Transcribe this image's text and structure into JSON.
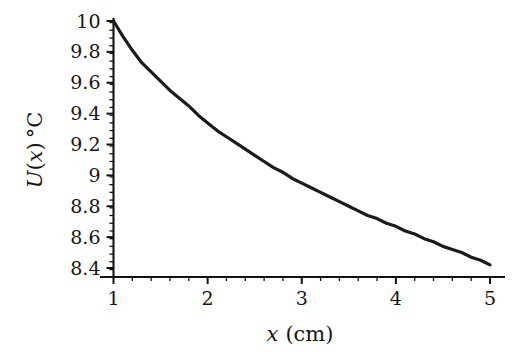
{
  "figure": {
    "background_color": "#ffffff",
    "curve_color": "#1b1b1b",
    "axis_color": "#111111"
  },
  "chart_data": {
    "type": "line",
    "title": "",
    "subtitle": "",
    "xlabel": "x (cm)",
    "xlabel_parts": {
      "variable": "x",
      "unit": "(cm)"
    },
    "ylabel": "U(x) °C",
    "ylabel_parts": {
      "function": "U",
      "open_paren": "(",
      "variable": "x",
      "close_paren": ")",
      "unit": "°C"
    },
    "xlim": [
      0.8,
      5.2
    ],
    "ylim": [
      8.34,
      10.06
    ],
    "xticks": [
      1,
      2,
      3,
      4,
      5
    ],
    "xtick_labels": [
      "1",
      "2",
      "3",
      "4",
      "5"
    ],
    "yticks": [
      8.4,
      8.6,
      8.8,
      9.0,
      9.2,
      9.4,
      9.6,
      9.8,
      10.0
    ],
    "ytick_labels": [
      "8.4",
      "8.6",
      "8.8",
      "9",
      "9.2",
      "9.4",
      "9.6",
      "9.8",
      "10"
    ],
    "x_minor_tick_step": 0.2,
    "y_minor_tick_step": 0.05,
    "grid": false,
    "legend": null,
    "legend_position": "none",
    "annotations": [],
    "series": [
      {
        "name": "U(x)",
        "x": [
          1.0,
          1.1,
          1.2,
          1.3,
          1.4,
          1.5,
          1.6,
          1.7,
          1.8,
          1.9,
          2.0,
          2.1,
          2.2,
          2.3,
          2.4,
          2.5,
          2.6,
          2.7,
          2.8,
          2.9,
          3.0,
          3.1,
          3.2,
          3.3,
          3.4,
          3.5,
          3.6,
          3.7,
          3.8,
          3.9,
          4.0,
          4.1,
          4.2,
          4.3,
          4.4,
          4.5,
          4.6,
          4.7,
          4.8,
          4.9,
          5.0
        ],
        "y": [
          10.0,
          9.9,
          9.81,
          9.73,
          9.67,
          9.61,
          9.55,
          9.5,
          9.45,
          9.39,
          9.34,
          9.29,
          9.25,
          9.21,
          9.17,
          9.13,
          9.09,
          9.05,
          9.02,
          8.98,
          8.95,
          8.92,
          8.89,
          8.86,
          8.83,
          8.8,
          8.77,
          8.74,
          8.72,
          8.69,
          8.67,
          8.64,
          8.62,
          8.59,
          8.57,
          8.54,
          8.52,
          8.5,
          8.47,
          8.45,
          8.42
        ]
      }
    ]
  }
}
